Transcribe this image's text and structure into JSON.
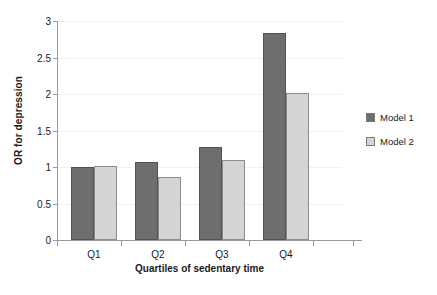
{
  "chart_data": {
    "type": "bar",
    "title": "",
    "xlabel": "Quartiles of sedentary time",
    "ylabel": "OR for depression",
    "categories": [
      "Q1",
      "Q2",
      "Q3",
      "Q4"
    ],
    "series": [
      {
        "name": "Model 1",
        "color": "#6e6e6e",
        "values": [
          1.0,
          1.07,
          1.28,
          2.84
        ]
      },
      {
        "name": "Model 2",
        "color": "#d4d4d4",
        "values": [
          1.01,
          0.86,
          1.1,
          2.01
        ]
      }
    ],
    "ylim": [
      0,
      3
    ],
    "yticks": [
      0,
      0.5,
      1,
      1.5,
      2,
      2.5,
      3
    ],
    "ytick_labels": [
      "0",
      "0.5",
      "1",
      "1.5",
      "2",
      "2.5",
      "3"
    ],
    "grid": true,
    "grid_axis": "y",
    "legend_position": "right",
    "legend": [
      "Model 1",
      "Model 2"
    ]
  }
}
